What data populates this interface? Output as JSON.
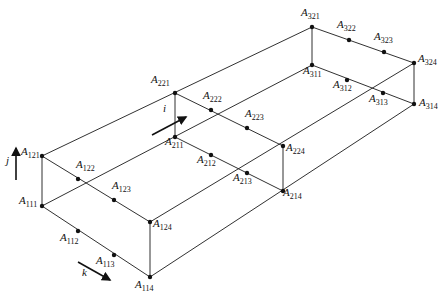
{
  "diagram": {
    "type": "isometric-box-lattice",
    "colors": {
      "line": "#1a1a1a",
      "node": "#111111",
      "background": "#ffffff"
    },
    "axes": [
      {
        "id": "i",
        "label": "i",
        "x1": 152,
        "y1": 135,
        "x2": 186,
        "y2": 117
      },
      {
        "id": "j",
        "label": "j",
        "x1": 16,
        "y1": 180,
        "x2": 16,
        "y2": 148
      },
      {
        "id": "k",
        "label": "k",
        "x1": 78,
        "y1": 262,
        "x2": 110,
        "y2": 280
      }
    ],
    "nodes": [
      {
        "id": "A111",
        "base": "A",
        "sub": "111",
        "x": 42,
        "y": 206,
        "lx": 19,
        "ly": 204
      },
      {
        "id": "A112",
        "base": "A",
        "sub": "112",
        "x": 78,
        "y": 231,
        "lx": 60,
        "ly": 241
      },
      {
        "id": "A113",
        "base": "A",
        "sub": "113",
        "x": 114,
        "y": 255,
        "lx": 96,
        "ly": 264
      },
      {
        "id": "A114",
        "base": "A",
        "sub": "114",
        "x": 150,
        "y": 277,
        "lx": 135,
        "ly": 288
      },
      {
        "id": "A121",
        "base": "A",
        "sub": "121",
        "x": 42,
        "y": 156,
        "lx": 21,
        "ly": 155
      },
      {
        "id": "A122",
        "base": "A",
        "sub": "122",
        "x": 78,
        "y": 179,
        "lx": 76,
        "ly": 168
      },
      {
        "id": "A123",
        "base": "A",
        "sub": "123",
        "x": 114,
        "y": 200,
        "lx": 112,
        "ly": 189
      },
      {
        "id": "A124",
        "base": "A",
        "sub": "124",
        "x": 150,
        "y": 222,
        "lx": 153,
        "ly": 227
      },
      {
        "id": "A211",
        "base": "A",
        "sub": "211",
        "x": 175,
        "y": 137,
        "lx": 165,
        "ly": 145
      },
      {
        "id": "A212",
        "base": "A",
        "sub": "212",
        "x": 211,
        "y": 155,
        "lx": 197,
        "ly": 163
      },
      {
        "id": "A213",
        "base": "A",
        "sub": "213",
        "x": 247,
        "y": 173,
        "lx": 233,
        "ly": 181
      },
      {
        "id": "A214",
        "base": "A",
        "sub": "214",
        "x": 283,
        "y": 191,
        "lx": 283,
        "ly": 196
      },
      {
        "id": "A221",
        "base": "A",
        "sub": "221",
        "x": 175,
        "y": 93,
        "lx": 151,
        "ly": 83
      },
      {
        "id": "A222",
        "base": "A",
        "sub": "222",
        "x": 211,
        "y": 110,
        "lx": 203,
        "ly": 99
      },
      {
        "id": "A223",
        "base": "A",
        "sub": "223",
        "x": 247,
        "y": 128,
        "lx": 245,
        "ly": 117
      },
      {
        "id": "A224",
        "base": "A",
        "sub": "224",
        "x": 283,
        "y": 146,
        "lx": 286,
        "ly": 151
      },
      {
        "id": "A311",
        "base": "A",
        "sub": "311",
        "x": 312,
        "y": 65,
        "lx": 303,
        "ly": 74
      },
      {
        "id": "A312",
        "base": "A",
        "sub": "312",
        "x": 347,
        "y": 80,
        "lx": 333,
        "ly": 88
      },
      {
        "id": "A313",
        "base": "A",
        "sub": "313",
        "x": 383,
        "y": 93,
        "lx": 369,
        "ly": 102
      },
      {
        "id": "A314",
        "base": "A",
        "sub": "314",
        "x": 414,
        "y": 104,
        "lx": 419,
        "ly": 106
      },
      {
        "id": "A321",
        "base": "A",
        "sub": "321",
        "x": 312,
        "y": 27,
        "lx": 301,
        "ly": 16
      },
      {
        "id": "A322",
        "base": "A",
        "sub": "322",
        "x": 349,
        "y": 40,
        "lx": 337,
        "ly": 28
      },
      {
        "id": "A323",
        "base": "A",
        "sub": "323",
        "x": 384,
        "y": 52,
        "lx": 374,
        "ly": 40
      },
      {
        "id": "A324",
        "base": "A",
        "sub": "324",
        "x": 414,
        "y": 63,
        "lx": 418,
        "ly": 62
      }
    ],
    "edges": [
      [
        "A121",
        "A124"
      ],
      [
        "A111",
        "A114"
      ],
      [
        "A121",
        "A111"
      ],
      [
        "A124",
        "A114"
      ],
      [
        "A221",
        "A224"
      ],
      [
        "A211",
        "A214"
      ],
      [
        "A221",
        "A211"
      ],
      [
        "A224",
        "A214"
      ],
      [
        "A321",
        "A324"
      ],
      [
        "A311",
        "A314"
      ],
      [
        "A321",
        "A311"
      ],
      [
        "A324",
        "A314"
      ],
      [
        "A121",
        "A321"
      ],
      [
        "A124",
        "A324"
      ],
      [
        "A111",
        "A311"
      ],
      [
        "A114",
        "A314"
      ]
    ]
  }
}
